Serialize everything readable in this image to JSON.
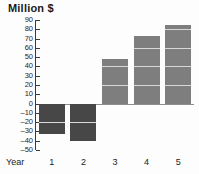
{
  "chart_data": {
    "type": "bar",
    "title": "Million $",
    "xlabel": "Year",
    "ylabel": "Million $",
    "categories": [
      "1",
      "2",
      "3",
      "4",
      "5"
    ],
    "values": [
      -33,
      -40,
      48,
      73,
      85
    ],
    "ylim": [
      -50,
      90
    ],
    "ytick_step": 10,
    "yticks": [
      90,
      80,
      70,
      60,
      50,
      40,
      30,
      20,
      10,
      0,
      -10,
      -20,
      -30,
      -40,
      -50
    ],
    "ytick_labels": [
      "90",
      "80",
      "70",
      "60",
      "50",
      "40",
      "30",
      "20",
      "10",
      "0",
      "–10",
      "–20",
      "–30",
      "–40",
      "–50"
    ],
    "grid": false,
    "legend": null,
    "zero_line": true,
    "bar_segment_step": 20,
    "series": [
      {
        "name": "Million $",
        "values": [
          -33,
          -40,
          48,
          73,
          85
        ]
      }
    ],
    "colors": {
      "bar_positive": "#7e7e7e",
      "bar_negative": "#474747",
      "bar_segment_line": "#d8d8d8",
      "axis": "#3a3a3a",
      "zero_line": "#8e8e8e",
      "text": "#1a1a1a",
      "background": "#fdfdfd"
    }
  },
  "axis_title": {
    "y": "Million $",
    "x": "Year"
  }
}
